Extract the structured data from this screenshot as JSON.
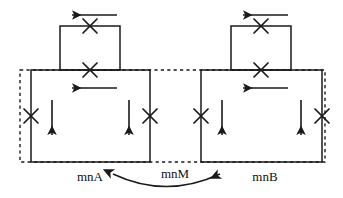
{
  "figure": {
    "name": "mn-state-transition-diagram",
    "background_color": "#ffffff",
    "stroke_color": "#1a1a1a",
    "width": 343,
    "height": 198
  },
  "labels": {
    "left": "mnA",
    "middle": "mnM",
    "right": "mnB"
  },
  "groups": [
    {
      "id": "left-group",
      "label": "mnA",
      "small_box": {
        "name": "upper-small-box",
        "x": 60,
        "y": 26,
        "width": 60,
        "height": 44,
        "style": "solid"
      },
      "large_box": {
        "name": "lower-large-box",
        "x": 31,
        "y": 70,
        "width": 119,
        "height": 92,
        "style": "solid"
      },
      "crosses": [
        {
          "name": "cross-top-box-top-edge",
          "cx": 90,
          "cy": 26
        },
        {
          "name": "cross-box-junction",
          "cx": 90,
          "cy": 70
        },
        {
          "name": "cross-left-edge",
          "cx": 31,
          "cy": 116
        },
        {
          "name": "cross-right-edge",
          "cx": 150,
          "cy": 116
        }
      ],
      "arrows": [
        {
          "name": "arrow-top-left",
          "direction": "left",
          "x1": 117,
          "y1": 15,
          "x2": 70,
          "y2": 15
        },
        {
          "name": "arrow-inner-left",
          "direction": "left",
          "x1": 117,
          "y1": 88,
          "x2": 70,
          "y2": 88
        },
        {
          "name": "arrow-inner-down-left",
          "direction": "down",
          "x1": 52,
          "y1": 100,
          "x2": 52,
          "y2": 137
        },
        {
          "name": "arrow-inner-down-right",
          "direction": "down",
          "x1": 129,
          "y1": 100,
          "x2": 129,
          "y2": 137
        }
      ]
    },
    {
      "id": "right-group",
      "label": "mnB",
      "small_box": {
        "name": "upper-small-box",
        "x": 231,
        "y": 26,
        "width": 60,
        "height": 44,
        "style": "solid"
      },
      "large_box": {
        "name": "lower-large-box",
        "x": 201,
        "y": 70,
        "width": 121,
        "height": 92,
        "style": "solid"
      },
      "crosses": [
        {
          "name": "cross-top-box-top-edge",
          "cx": 261,
          "cy": 26
        },
        {
          "name": "cross-box-junction",
          "cx": 261,
          "cy": 70
        },
        {
          "name": "cross-left-edge",
          "cx": 201,
          "cy": 116
        },
        {
          "name": "cross-right-edge",
          "cx": 322,
          "cy": 116
        }
      ],
      "arrows": [
        {
          "name": "arrow-top-left",
          "direction": "left",
          "x1": 288,
          "y1": 15,
          "x2": 241,
          "y2": 15
        },
        {
          "name": "arrow-inner-left",
          "direction": "left",
          "x1": 288,
          "y1": 88,
          "x2": 241,
          "y2": 88
        },
        {
          "name": "arrow-inner-down-left",
          "direction": "down",
          "x1": 222,
          "y1": 100,
          "x2": 222,
          "y2": 137
        },
        {
          "name": "arrow-inner-down-right",
          "direction": "down",
          "x1": 301,
          "y1": 100,
          "x2": 301,
          "y2": 137
        }
      ]
    }
  ],
  "dashed_region": {
    "name": "shared-dashed-boundary",
    "x": 20,
    "y": 70,
    "width": 305,
    "height": 92,
    "style": "dashed"
  },
  "connector": {
    "name": "mnM-bidirectional-arc",
    "type": "double-headed-curved-arrow",
    "from": "mnA",
    "to": "mnB",
    "start": {
      "x": 111,
      "y": 173
    },
    "control": {
      "x": 166,
      "y": 198
    },
    "end": {
      "x": 222,
      "y": 173
    }
  },
  "label_positions": {
    "left": {
      "x": 90,
      "y": 180
    },
    "middle": {
      "x": 175,
      "y": 178
    },
    "right": {
      "x": 265,
      "y": 180
    }
  }
}
